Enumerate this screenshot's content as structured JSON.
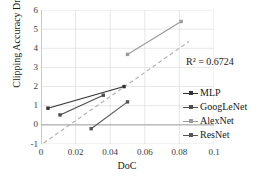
{
  "chart_data": {
    "type": "scatter",
    "title": "",
    "xlabel": "DoC",
    "ylabel": "Clipping Accuracy Drop",
    "xlim": [
      0,
      0.1
    ],
    "ylim": [
      -1,
      6
    ],
    "xticks": [
      "0",
      "0.02",
      "0.04",
      "0.06",
      "0.08",
      "0.1"
    ],
    "xtick_values": [
      0,
      0.02,
      0.04,
      0.06,
      0.08,
      0.1
    ],
    "yticks": [
      "6",
      "5",
      "4",
      "3",
      "2",
      "1",
      "0",
      "-1"
    ],
    "ytick_values": [
      6,
      5,
      4,
      3,
      2,
      1,
      0,
      -1
    ],
    "grid": true,
    "legend_position": "inside-right",
    "annotations": [
      {
        "name": "r2-annotation",
        "text": "R² = 0.6724",
        "x": 0.073,
        "y": 3.55
      }
    ],
    "trendline": {
      "name": "linear-trendline",
      "style": "dashed",
      "color": "#b3b3b3",
      "r_squared": 0.6724,
      "x": [
        0.0015,
        0.0855
      ],
      "y": [
        -0.95,
        4.35
      ]
    },
    "series": [
      {
        "name": "MLP",
        "color": "#333333",
        "marker": "square",
        "points": [
          {
            "x": 0.004,
            "y": 0.87
          },
          {
            "x": 0.048,
            "y": 2.0
          }
        ]
      },
      {
        "name": "GoogLeNet",
        "color": "#4d4d4d",
        "marker": "square",
        "points": [
          {
            "x": 0.011,
            "y": 0.52
          },
          {
            "x": 0.036,
            "y": 1.55
          }
        ]
      },
      {
        "name": "AlexNet",
        "color": "#9a9a9a",
        "marker": "square",
        "points": [
          {
            "x": 0.05,
            "y": 3.68
          },
          {
            "x": 0.081,
            "y": 5.4
          }
        ]
      },
      {
        "name": "ResNet",
        "color": "#555555",
        "marker": "square",
        "points": [
          {
            "x": 0.029,
            "y": -0.2
          },
          {
            "x": 0.05,
            "y": 1.2
          }
        ]
      }
    ]
  },
  "axes": {
    "x_title": "DoC",
    "y_title": "Clipping Accuracy Drop"
  },
  "legend": {
    "items": [
      {
        "label": "MLP"
      },
      {
        "label": "GoogLeNet"
      },
      {
        "label": "AlexNet"
      },
      {
        "label": "ResNet"
      }
    ]
  }
}
